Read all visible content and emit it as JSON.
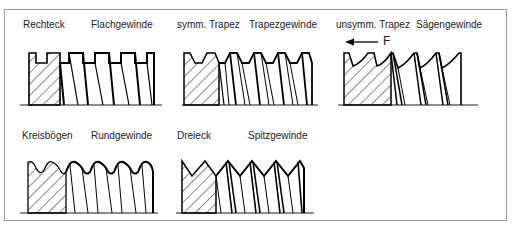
{
  "panels": [
    {
      "profile": "Rechteck",
      "name": "Flachgewinde"
    },
    {
      "profile": "symm. Trapez",
      "name": "Trapezgewinde"
    },
    {
      "profile": "unsymm. Trapez",
      "name": "Sägengewinde",
      "force_label": "F"
    },
    {
      "profile": "Kreisbögen",
      "name": "Rundgewinde"
    },
    {
      "profile": "Dreieck",
      "name": "Spitzgewinde"
    }
  ],
  "colors": {
    "line": "#000000",
    "frame": "#9a9a9a",
    "text": "#222222"
  }
}
